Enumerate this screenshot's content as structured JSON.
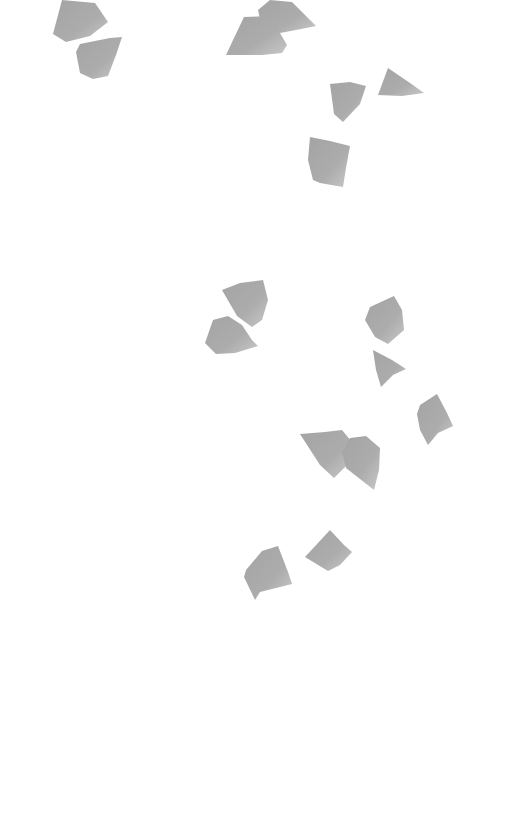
{
  "scene": {
    "width": 526,
    "height": 836,
    "background": "#ffffff",
    "petal_color": "#a9a9a9",
    "petal_highlight": "#d4d4d4",
    "petals": [
      {
        "id": "petal-1",
        "points": "62,0 95,3 108,22 90,36 66,42 53,34"
      },
      {
        "id": "petal-2",
        "points": "80,44 110,38 122,37 116,55 108,76 93,79 80,73 76,52"
      },
      {
        "id": "petal-3",
        "points": "258,10 270,0 292,2 316,26 296,30 280,33 262,28"
      },
      {
        "id": "petal-4",
        "points": "244,17 270,16 280,33 287,45 282,53 262,55 226,55 234,38"
      },
      {
        "id": "petal-5",
        "points": "330,84 350,82 366,86 360,104 343,122 334,114"
      },
      {
        "id": "petal-6",
        "points": "388,68 410,83 424,93 402,96 378,95"
      },
      {
        "id": "petal-7",
        "points": "310,137 330,141 350,146 346,168 343,187 320,183 313,180 308,160"
      },
      {
        "id": "petal-8",
        "points": "222,290 240,283 263,280 268,300 262,320 252,327 237,316"
      },
      {
        "id": "petal-9",
        "points": "213,320 228,316 242,325 252,340 258,346 235,353 216,354 205,343"
      },
      {
        "id": "petal-10",
        "points": "370,307 394,296 402,310 404,330 388,344 375,337 365,320"
      },
      {
        "id": "petal-11",
        "points": "373,350 392,360 406,369 393,375 381,387 376,370"
      },
      {
        "id": "petal-12",
        "points": "420,405 437,394 447,413 453,426 438,433 428,445 420,430 417,414"
      },
      {
        "id": "petal-13",
        "points": "300,434 325,432 342,430 352,442 346,466 334,478 320,465"
      },
      {
        "id": "petal-14",
        "points": "350,438 366,436 380,448 379,470 374,490 346,468 342,452"
      },
      {
        "id": "petal-15",
        "points": "305,557 330,530 344,545 352,552 340,565 328,571"
      },
      {
        "id": "petal-16",
        "points": "246,570 262,551 278,546 288,572 292,584 260,592 255,600 244,577"
      }
    ]
  }
}
